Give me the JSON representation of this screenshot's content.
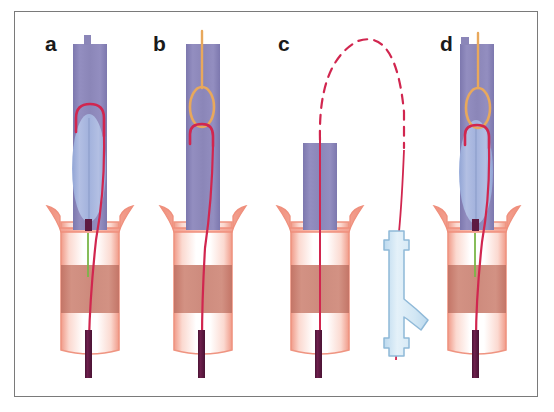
{
  "figure": {
    "panel_count": 4,
    "border_color": "#7a7a7a",
    "background_color": "#ffffff",
    "width": 554,
    "height": 412
  },
  "palette": {
    "sheath_purple": "#8b86b8",
    "sheath_purple_dark": "#7b76ac",
    "balloon_blue": "#9fb2dd",
    "balloon_blue_light": "#b9c6e6",
    "vessel_pink": "#f5a99a",
    "vessel_pink_light": "#fbd4cb",
    "vessel_band_dark": "#c4766a",
    "wire_red": "#d1264f",
    "wire_red_light": "#e05070",
    "snare_orange": "#e8a85c",
    "rod_purple": "#5e1a42",
    "connector_blue": "#cfe4f2",
    "connector_outline": "#8fb9d8",
    "guide_green": "#7ab648",
    "label_black": "#1a1a1a"
  },
  "panels": [
    {
      "id": "a",
      "letter": "a",
      "caption_label": "a",
      "description": "Antegrade sheath with inflated balloon; red guidewire loop formed inside the sheath lumen above the balloon, wire tracking down through the flared ostium into the vessel.",
      "components": [
        {
          "name": "delivery-sheath",
          "color": "#8b86b8",
          "shape": "vertical-tube"
        },
        {
          "name": "sheath-top-nub",
          "color": "#8b86b8",
          "shape": "small-stub"
        },
        {
          "name": "balloon",
          "color": "#9fb2dd",
          "shape": "ellipse"
        },
        {
          "name": "guidewire-loop",
          "color": "#d1264f",
          "shape": "inverted-u-loop"
        },
        {
          "name": "guidewire-shaft",
          "color": "#d1264f",
          "shape": "line"
        },
        {
          "name": "flared-ostium",
          "color": "#f5a99a",
          "shape": "trumpet-flare"
        },
        {
          "name": "vessel-wall",
          "color": "#f5a99a",
          "shape": "vertical-tube"
        },
        {
          "name": "vessel-stenosis-band",
          "color": "#c4766a",
          "shape": "band"
        },
        {
          "name": "marker-stub-purple",
          "color": "#5e1a42",
          "shape": "small-rect"
        },
        {
          "name": "green-guide-marker",
          "color": "#7ab648",
          "shape": "line"
        },
        {
          "name": "retrograde-rod",
          "color": "#5e1a42",
          "shape": "vertical-rod"
        }
      ]
    },
    {
      "id": "b",
      "letter": "b",
      "caption_label": "b",
      "description": "Snare catheter advanced from above; the orange snare loop has captured the apex of the red guidewire loop inside the sheath. Balloon deflated and removed.",
      "components": [
        {
          "name": "delivery-sheath",
          "color": "#8b86b8",
          "shape": "vertical-tube"
        },
        {
          "name": "snare-shaft",
          "color": "#e8a85c",
          "shape": "line"
        },
        {
          "name": "snare-loop",
          "color": "#e8a85c",
          "shape": "oval-loop"
        },
        {
          "name": "guidewire-loop",
          "color": "#d1264f",
          "shape": "hook-loop"
        },
        {
          "name": "guidewire-shaft",
          "color": "#d1264f",
          "shape": "line"
        },
        {
          "name": "flared-ostium",
          "color": "#f5a99a",
          "shape": "trumpet-flare"
        },
        {
          "name": "vessel-wall",
          "color": "#f5a99a",
          "shape": "vertical-tube"
        },
        {
          "name": "vessel-stenosis-band",
          "color": "#c4766a",
          "shape": "band"
        },
        {
          "name": "retrograde-rod",
          "color": "#5e1a42",
          "shape": "vertical-rod"
        }
      ]
    },
    {
      "id": "c",
      "letter": "c",
      "caption_label": "c",
      "description": "Guidewire externalised: the wire arcs out of the shortened sheath (dashed segment indicating continuation outside the body) and passes down into a haemostatic Y-connector on the retrograde access.",
      "components": [
        {
          "name": "short-sheath",
          "color": "#8b86b8",
          "shape": "short-tube"
        },
        {
          "name": "guidewire-dashed-arc",
          "color": "#d1264f",
          "shape": "dashed-arc"
        },
        {
          "name": "guidewire-shaft",
          "color": "#d1264f",
          "shape": "line"
        },
        {
          "name": "flared-ostium",
          "color": "#f5a99a",
          "shape": "trumpet-flare"
        },
        {
          "name": "vessel-wall",
          "color": "#f5a99a",
          "shape": "vertical-tube"
        },
        {
          "name": "vessel-stenosis-band",
          "color": "#c4766a",
          "shape": "band"
        },
        {
          "name": "retrograde-rod",
          "color": "#5e1a42",
          "shape": "vertical-rod"
        },
        {
          "name": "haemostatic-y-connector",
          "color": "#cfe4f2",
          "shape": "y-valve"
        }
      ]
    },
    {
      "id": "d",
      "letter": "d",
      "caption_label": "d",
      "description": "Final configuration: snare and guidewire loop both within the sheath, balloon reinflated across the lesion with through-and-through wire access maintained.",
      "components": [
        {
          "name": "delivery-sheath",
          "color": "#8b86b8",
          "shape": "vertical-tube"
        },
        {
          "name": "sheath-top-nub",
          "color": "#8b86b8",
          "shape": "small-stub"
        },
        {
          "name": "snare-shaft",
          "color": "#e8a85c",
          "shape": "line"
        },
        {
          "name": "snare-loop",
          "color": "#e8a85c",
          "shape": "oval-loop"
        },
        {
          "name": "balloon",
          "color": "#9fb2dd",
          "shape": "ellipse"
        },
        {
          "name": "guidewire-loop",
          "color": "#d1264f",
          "shape": "hook-loop"
        },
        {
          "name": "guidewire-shaft",
          "color": "#d1264f",
          "shape": "line"
        },
        {
          "name": "flared-ostium",
          "color": "#f5a99a",
          "shape": "trumpet-flare"
        },
        {
          "name": "vessel-wall",
          "color": "#f5a99a",
          "shape": "vertical-tube"
        },
        {
          "name": "vessel-stenosis-band",
          "color": "#c4766a",
          "shape": "band"
        },
        {
          "name": "marker-stub-purple",
          "color": "#5e1a42",
          "shape": "small-rect"
        },
        {
          "name": "green-guide-marker",
          "color": "#7ab648",
          "shape": "line"
        },
        {
          "name": "retrograde-rod",
          "color": "#5e1a42",
          "shape": "vertical-rod"
        }
      ]
    }
  ]
}
